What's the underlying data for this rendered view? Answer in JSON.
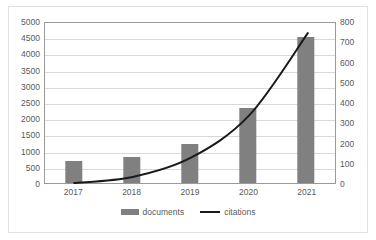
{
  "chart_data": {
    "type": "bar",
    "title": "",
    "subtitle": "",
    "xlabel": "",
    "ylabel": "",
    "categories": [
      "2017",
      "2018",
      "2019",
      "2020",
      "2021"
    ],
    "series": [
      {
        "name": "documents",
        "type": "bar",
        "axis": "left",
        "color": "#808080",
        "values": [
          680,
          800,
          1200,
          2300,
          4500
        ]
      },
      {
        "name": "citations",
        "type": "line",
        "axis": "right",
        "color": "#1a1a1a",
        "values": [
          10,
          40,
          135,
          345,
          750
        ]
      }
    ],
    "left_axis": {
      "min": 0,
      "max": 5000,
      "step": 500,
      "ticks": [
        "0",
        "500",
        "1000",
        "1500",
        "2000",
        "2500",
        "3000",
        "3500",
        "4000",
        "4500",
        "5000"
      ]
    },
    "right_axis": {
      "min": 0,
      "max": 800,
      "step": 100,
      "ticks": [
        "0",
        "100",
        "200",
        "300",
        "400",
        "500",
        "600",
        "700",
        "800"
      ]
    },
    "grid": true,
    "legend_position": "bottom"
  },
  "legend": {
    "documents_label": "documents",
    "citations_label": "citations"
  },
  "colors": {
    "bar": "#808080",
    "line": "#1a1a1a",
    "gridline": "#d9d9d9",
    "axis_text": "#5a5a5a",
    "plot_border": "#9a9a9a",
    "frame_border": "#e2e2e2",
    "background": "#ffffff"
  }
}
